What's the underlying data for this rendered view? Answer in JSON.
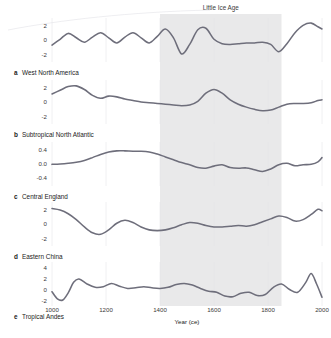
{
  "figure": {
    "band_label": "Little Ice Age",
    "x_axis_title": "Year (ce)",
    "x_ticks": [
      1000,
      1200,
      1400,
      1600,
      1800,
      2000
    ],
    "x_range": [
      1000,
      2000
    ],
    "band_range": [
      1400,
      1850
    ],
    "curve_color": "#6e6e7b",
    "band_color": "#e9e9ea"
  },
  "chart_data": {
    "type": "line",
    "title": "Little Ice Age",
    "xlabel": "Year (ce)",
    "ylabel": "",
    "xlim": [
      1000,
      2000
    ],
    "grid": true,
    "legend": "none",
    "annotations": [
      {
        "text": "Little Ice Age",
        "x_start": 1400,
        "x_end": 1850,
        "style": "shaded band"
      }
    ],
    "panels": [
      {
        "letter": "a",
        "name": "West North America",
        "ylim": [
          -3,
          3
        ],
        "y_ticks": [
          2,
          0,
          -2
        ],
        "y_tick_labels": [
          "2",
          "0",
          "-2"
        ],
        "x": [
          1000,
          1030,
          1060,
          1090,
          1120,
          1150,
          1180,
          1210,
          1240,
          1270,
          1300,
          1330,
          1360,
          1390,
          1420,
          1450,
          1480,
          1510,
          1540,
          1570,
          1600,
          1630,
          1660,
          1690,
          1720,
          1750,
          1780,
          1810,
          1840,
          1870,
          1900,
          1930,
          1960,
          1985,
          2000
        ],
        "y": [
          -0.7,
          0.1,
          0.9,
          0.3,
          -0.3,
          0.4,
          1.0,
          0.3,
          -0.4,
          0.4,
          1.0,
          0.3,
          -0.4,
          0.5,
          1.5,
          0.3,
          -1.9,
          -0.6,
          1.4,
          1.6,
          0.1,
          -0.5,
          -0.6,
          -0.5,
          -0.4,
          -0.4,
          -0.3,
          -0.6,
          -1.6,
          -0.5,
          1.0,
          2.0,
          2.3,
          1.8,
          1.5
        ]
      },
      {
        "letter": "b",
        "name": "Subtropical North Atlantic",
        "ylim": [
          -3,
          3
        ],
        "y_ticks": [
          2,
          0,
          -2
        ],
        "y_tick_labels": [
          "2",
          "0",
          "-2"
        ],
        "x": [
          1000,
          1030,
          1060,
          1090,
          1120,
          1150,
          1180,
          1210,
          1240,
          1270,
          1300,
          1330,
          1360,
          1390,
          1420,
          1450,
          1480,
          1510,
          1540,
          1570,
          1600,
          1630,
          1660,
          1690,
          1720,
          1750,
          1780,
          1810,
          1840,
          1870,
          1900,
          1930,
          1960,
          1985,
          2000
        ],
        "y": [
          1.1,
          1.6,
          2.1,
          2.2,
          1.7,
          0.9,
          0.5,
          0.8,
          0.7,
          0.4,
          0.2,
          0.0,
          -0.1,
          -0.2,
          -0.3,
          -0.4,
          -0.5,
          -0.4,
          0.1,
          1.2,
          1.7,
          1.2,
          0.3,
          -0.3,
          -0.7,
          -1.0,
          -1.2,
          -1.1,
          -0.7,
          -0.3,
          -0.2,
          -0.2,
          -0.1,
          0.2,
          0.3
        ]
      },
      {
        "letter": "c",
        "name": "Central England",
        "ylim": [
          -0.62,
          0.62
        ],
        "y_ticks": [
          0.4,
          0.0,
          -0.4
        ],
        "y_tick_labels": [
          "0.4",
          "0.0",
          "-0.4"
        ],
        "x": [
          1000,
          1030,
          1060,
          1090,
          1120,
          1150,
          1180,
          1210,
          1240,
          1270,
          1300,
          1330,
          1360,
          1390,
          1420,
          1450,
          1480,
          1510,
          1540,
          1570,
          1600,
          1630,
          1660,
          1690,
          1720,
          1750,
          1780,
          1810,
          1840,
          1870,
          1900,
          1930,
          1960,
          1985,
          2000
        ],
        "y": [
          -0.01,
          0.0,
          0.02,
          0.05,
          0.1,
          0.18,
          0.27,
          0.34,
          0.37,
          0.37,
          0.36,
          0.36,
          0.34,
          0.28,
          0.2,
          0.12,
          0.04,
          -0.02,
          -0.1,
          -0.12,
          -0.06,
          -0.02,
          -0.1,
          -0.12,
          -0.11,
          -0.16,
          -0.21,
          -0.14,
          -0.02,
          0.02,
          -0.05,
          -0.02,
          -0.01,
          0.06,
          0.18
        ]
      },
      {
        "letter": "d",
        "name": "Eastern China",
        "ylim": [
          -3,
          3
        ],
        "y_ticks": [
          2,
          0,
          -2
        ],
        "y_tick_labels": [
          "2",
          "0",
          "-2"
        ],
        "x": [
          1000,
          1030,
          1060,
          1090,
          1120,
          1150,
          1180,
          1210,
          1240,
          1270,
          1300,
          1330,
          1360,
          1390,
          1420,
          1450,
          1480,
          1510,
          1540,
          1570,
          1600,
          1630,
          1660,
          1690,
          1720,
          1750,
          1780,
          1810,
          1840,
          1870,
          1900,
          1930,
          1960,
          1985,
          2000
        ],
        "y": [
          2.1,
          1.9,
          1.4,
          0.6,
          -0.4,
          -1.2,
          -1.4,
          -0.8,
          0.1,
          0.5,
          0.2,
          -0.4,
          -0.8,
          -0.9,
          -0.8,
          -0.5,
          -0.1,
          0.2,
          0.1,
          -0.2,
          -0.4,
          -0.4,
          -0.3,
          -0.2,
          -0.3,
          -0.1,
          0.3,
          0.7,
          1.1,
          0.9,
          0.4,
          0.6,
          1.3,
          2.0,
          1.8
        ]
      },
      {
        "letter": "e",
        "name": "Tropical Andes",
        "ylim": [
          -3,
          5
        ],
        "y_ticks": [
          4,
          2,
          0,
          -2
        ],
        "y_tick_labels": [
          "4",
          "2",
          "0",
          "-2"
        ],
        "x": [
          1000,
          1020,
          1040,
          1060,
          1080,
          1100,
          1130,
          1160,
          1190,
          1220,
          1250,
          1280,
          1310,
          1340,
          1370,
          1400,
          1430,
          1460,
          1490,
          1520,
          1550,
          1580,
          1610,
          1640,
          1670,
          1700,
          1730,
          1760,
          1790,
          1820,
          1850,
          1880,
          1910,
          1940,
          1960,
          1980,
          2000
        ],
        "y": [
          -0.4,
          -1.7,
          -1.9,
          -0.6,
          1.3,
          1.9,
          1.0,
          0.4,
          0.5,
          1.1,
          0.6,
          0.2,
          0.3,
          0.5,
          0.3,
          0.2,
          0.4,
          0.9,
          1.1,
          0.8,
          0.2,
          -0.3,
          -0.5,
          -1.2,
          -1.3,
          -0.7,
          -0.5,
          -1.1,
          -0.9,
          0.4,
          1.0,
          0.0,
          -0.5,
          1.3,
          2.9,
          1.0,
          -1.4
        ]
      }
    ]
  }
}
